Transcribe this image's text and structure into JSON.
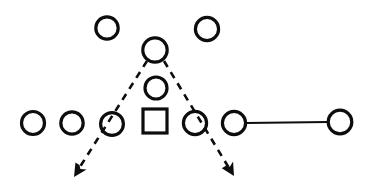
{
  "diagram": {
    "canvas": {
      "width": 375,
      "height": 192,
      "background": "#ffffff"
    },
    "style": {
      "stroke_color": "#0d0d0d",
      "node_stroke_width": 3.2,
      "solid_edge_stroke_width": 1.8,
      "dashed_edge_stroke_width": 2.6,
      "dash_pattern": "7 6"
    },
    "nodes": [
      {
        "id": "circle-top-left",
        "shape": "circle",
        "label": "",
        "cx": 107,
        "cy": 28,
        "r": 11.2
      },
      {
        "id": "circle-top-right",
        "shape": "circle",
        "label": "",
        "cx": 207,
        "cy": 29,
        "r": 11.6
      },
      {
        "id": "circle-apex",
        "shape": "circle",
        "label": "",
        "cx": 155,
        "cy": 50,
        "r": 12.2
      },
      {
        "id": "circle-middle",
        "shape": "circle",
        "label": "",
        "cx": 156,
        "cy": 88,
        "r": 11.0
      },
      {
        "id": "square-center",
        "shape": "square",
        "label": "",
        "cx": 155,
        "cy": 121,
        "size": 24
      },
      {
        "id": "circle-row-1",
        "shape": "circle",
        "label": "",
        "cx": 33,
        "cy": 123,
        "r": 11.5
      },
      {
        "id": "circle-row-2",
        "shape": "circle",
        "label": "",
        "cx": 72,
        "cy": 123,
        "r": 11.2
      },
      {
        "id": "circle-row-3",
        "shape": "circle",
        "label": "",
        "cx": 112,
        "cy": 124,
        "r": 11.4
      },
      {
        "id": "circle-row-4",
        "shape": "circle",
        "label": "",
        "cx": 195,
        "cy": 123,
        "r": 11.6
      },
      {
        "id": "circle-row-5",
        "shape": "circle",
        "label": "",
        "cx": 234,
        "cy": 123,
        "r": 11.6
      },
      {
        "id": "circle-row-6",
        "shape": "circle",
        "label": "",
        "cx": 340,
        "cy": 122,
        "r": 11.8
      }
    ],
    "edges": [
      {
        "id": "edge-solid-right",
        "type": "solid",
        "arrow": false,
        "from": "circle-row-5",
        "to": "circle-row-6",
        "x1": 246,
        "y1": 123,
        "x2": 328,
        "y2": 122
      },
      {
        "id": "edge-dashed-left",
        "type": "dashed",
        "arrow": true,
        "from": "circle-apex",
        "to": "arrow-left",
        "x1": 147,
        "y1": 61,
        "x2": 78,
        "y2": 170
      },
      {
        "id": "edge-dashed-right",
        "type": "dashed",
        "arrow": true,
        "from": "circle-apex",
        "to": "arrow-right",
        "x1": 164,
        "y1": 61,
        "x2": 229,
        "y2": 168
      }
    ],
    "arrowheads": [
      {
        "id": "arrow-left",
        "tip_x": 74,
        "tip_y": 177,
        "angle_deg": 122,
        "size": 13
      },
      {
        "id": "arrow-right",
        "tip_x": 234,
        "tip_y": 176,
        "angle_deg": 59,
        "size": 13
      }
    ]
  }
}
